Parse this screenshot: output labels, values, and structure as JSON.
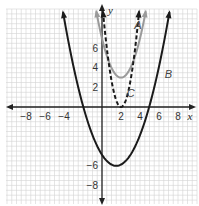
{
  "chart_data": {
    "type": "line",
    "title": "",
    "xlabel": "x",
    "ylabel": "y",
    "xlim": [
      -10,
      10
    ],
    "ylim": [
      -10,
      10
    ],
    "grid": true,
    "x_ticks": [
      -8,
      -6,
      -4,
      2,
      4,
      6,
      8
    ],
    "y_ticks": [
      -8,
      -6,
      2,
      4,
      6
    ],
    "x_tick_labels": [
      "−8",
      "−6",
      "−4",
      "2",
      "4",
      "6",
      "8"
    ],
    "y_tick_labels": [
      "−8",
      "−6",
      "2",
      "4",
      "6"
    ],
    "series": [
      {
        "name": "A",
        "style": "solid",
        "color": "#9a9a9a",
        "vertex": [
          2,
          3
        ],
        "a": 1.0,
        "equation": "y = (x − 2)² + 3",
        "x_range": [
          -0.6,
          4.6
        ],
        "label_pos": [
          3.4,
          8
        ]
      },
      {
        "name": "B",
        "style": "solid",
        "color": "#1a1a1a",
        "vertex": [
          1.5,
          -6
        ],
        "a": 0.5,
        "equation": "y ≈ 0.5(x − 1.5)² − 6",
        "x_range": [
          -4.1,
          7.1
        ],
        "label_pos": [
          6.6,
          3
        ]
      },
      {
        "name": "C",
        "style": "dashed",
        "color": "#1a1a1a",
        "vertex": [
          2,
          0
        ],
        "a": 2.7,
        "equation": "y ≈ 2.7(x − 2)²",
        "x_range": [
          0.1,
          3.9
        ],
        "label_pos": [
          2.6,
          1
        ]
      }
    ],
    "legend": "inline labels A, B, C near curves"
  }
}
